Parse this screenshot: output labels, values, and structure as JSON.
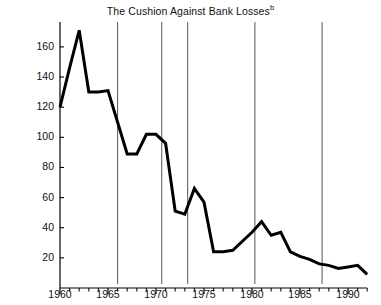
{
  "chart_data": {
    "type": "line",
    "title": "The Cushion Against Bank Losses",
    "title_superscript": "b",
    "xlabel": "",
    "ylabel": "",
    "xlim": [
      1960,
      1992
    ],
    "ylim": [
      0,
      178
    ],
    "grid": false,
    "legend": null,
    "line_color": "#000000",
    "recession_line_color": "#555555",
    "x": [
      1960,
      1961,
      1962,
      1963,
      1964,
      1965,
      1966,
      1967,
      1968,
      1969,
      1970,
      1971,
      1972,
      1973,
      1974,
      1975,
      1976,
      1977,
      1978,
      1979,
      1980,
      1981,
      1982,
      1983,
      1984,
      1985,
      1986,
      1987,
      1988,
      1989,
      1990,
      1991,
      1992
    ],
    "values": [
      120,
      146,
      171,
      130,
      130,
      131,
      110,
      89,
      89,
      102,
      102,
      96,
      51,
      49,
      66,
      57,
      24,
      24,
      25,
      31,
      37,
      44,
      35,
      37,
      24,
      21,
      19,
      16,
      15,
      13,
      14,
      15,
      9
    ],
    "yticks": [
      20,
      40,
      60,
      80,
      100,
      120,
      140,
      160
    ],
    "ytick_labels": [
      "20",
      "40",
      "60",
      "80",
      "100",
      "120",
      "140",
      "160"
    ],
    "xticks_major": [
      1960,
      1965,
      1970,
      1975,
      1980,
      1985,
      1990
    ],
    "xtick_labels": [
      "1960",
      "1965",
      "1970",
      "1975",
      "1980",
      "1985",
      "1990"
    ],
    "xticks_minor_step": 1,
    "recession_markers": [
      1966.0,
      1970.6,
      1973.3,
      1980.3,
      1987.3
    ],
    "annotations": []
  }
}
